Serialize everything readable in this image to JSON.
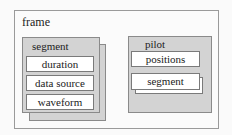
{
  "frame": {
    "label": "frame",
    "segment": {
      "label": "segment",
      "fields": [
        {
          "label": "duration"
        },
        {
          "label": "data source"
        },
        {
          "label": "waveform"
        }
      ]
    },
    "pilot": {
      "label": "pilot",
      "fields": [
        {
          "label": "positions"
        },
        {
          "label": "segment"
        }
      ]
    }
  },
  "colors": {
    "container_fill": "#d3d3d3",
    "field_fill": "#ffffff",
    "border": "#8a8a8a"
  }
}
